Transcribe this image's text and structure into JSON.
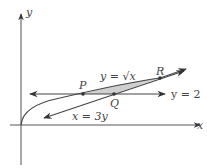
{
  "diagram": {
    "axes": {
      "x_label": "x",
      "y_label": "y"
    },
    "curves": [
      {
        "name": "sqrt-curve",
        "label": "y = √x"
      },
      {
        "name": "line-x-3y",
        "label": "x = 3y"
      },
      {
        "name": "line-y-2",
        "label": "y = 2"
      }
    ],
    "points": [
      {
        "name": "P",
        "label": "P"
      },
      {
        "name": "Q",
        "label": "Q"
      },
      {
        "name": "R",
        "label": "R"
      }
    ],
    "shaded_region": "region-between-curve-and-lines-PQR",
    "colors": {
      "stroke": "#444444",
      "shade": "#cfcfcf",
      "background": "#ffffff"
    }
  }
}
